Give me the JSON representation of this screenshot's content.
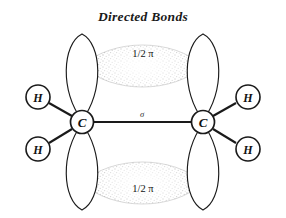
{
  "figure": {
    "title": "Directed Bonds",
    "background_color": "#ffffff",
    "stroke_color": "#1a1a1a",
    "cloud_fill_color": "#9a9a9a"
  },
  "atoms": [
    {
      "id": "carbon-left",
      "label": "C",
      "cx": 82,
      "cy": 122,
      "r": 11.5
    },
    {
      "id": "carbon-right",
      "label": "C",
      "cx": 203,
      "cy": 122,
      "r": 11.5
    },
    {
      "id": "hydrogen-top-left",
      "label": "H",
      "cx": 38,
      "cy": 97,
      "r": 12
    },
    {
      "id": "hydrogen-bottom-left",
      "label": "H",
      "cx": 38,
      "cy": 149,
      "r": 12
    },
    {
      "id": "hydrogen-top-right",
      "label": "H",
      "cx": 248,
      "cy": 97,
      "r": 12
    },
    {
      "id": "hydrogen-bottom-right",
      "label": "H",
      "cx": 248,
      "cy": 149,
      "r": 12
    }
  ],
  "bonds": {
    "sigma_label": "σ",
    "sigma_label_x": 142,
    "sigma_label_y": 117
  },
  "pi_clouds": [
    {
      "id": "pi-cloud-top",
      "label": "1/2 π",
      "label_x": 143,
      "label_y": 57
    },
    {
      "id": "pi-cloud-bottom",
      "label": "1/2 π",
      "label_x": 143,
      "label_y": 192
    }
  ],
  "labels": {
    "carbon": "C",
    "hydrogen": "H",
    "sigma": "σ",
    "half_pi": "1/2 π"
  }
}
